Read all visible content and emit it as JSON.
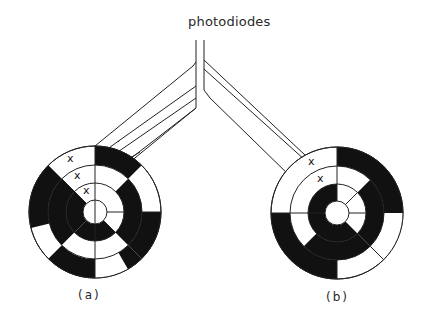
{
  "diagram": {
    "title": "photodiodes",
    "panels": [
      {
        "label": "(a)",
        "description": "code disc with three x-marked read positions along radius, fibers leading up to photodiodes"
      },
      {
        "label": "(b)",
        "description": "code disc with three x-marked read positions, fibers leading up to photodiodes"
      }
    ],
    "markers": [
      "x",
      "x",
      "x"
    ],
    "colors": {
      "ink": "#111111",
      "paper": "#ffffff"
    }
  }
}
